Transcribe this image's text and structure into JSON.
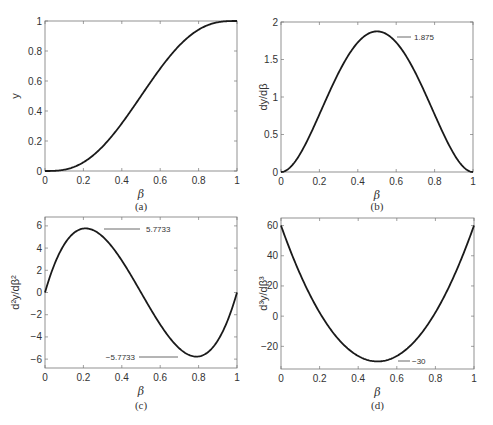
{
  "chart_data": [
    {
      "id": "a",
      "type": "line",
      "caption": "(a)",
      "title": "",
      "xlabel": "β",
      "ylabel": "y",
      "xlim": [
        0,
        1
      ],
      "ylim": [
        0,
        1
      ],
      "xticks": [
        0,
        0.2,
        0.4,
        0.6,
        0.8,
        1
      ],
      "xtick_labels": [
        "0",
        "0.2",
        "0.4",
        "0.6",
        "0.8",
        "1"
      ],
      "yticks": [
        0,
        0.2,
        0.4,
        0.6,
        0.8,
        1
      ],
      "ytick_labels": [
        "0",
        "0.2",
        "0.4",
        "0.6",
        "0.8",
        "1"
      ],
      "grid": false,
      "function": "y = 6β^5 - 15β^4 + 10β^3",
      "x": [
        0,
        0.1,
        0.2,
        0.3,
        0.4,
        0.5,
        0.6,
        0.7,
        0.8,
        0.9,
        1.0
      ],
      "values": [
        0,
        0.0086,
        0.0579,
        0.1631,
        0.3174,
        0.5,
        0.6826,
        0.8369,
        0.9421,
        0.9914,
        1.0
      ],
      "annotations": []
    },
    {
      "id": "b",
      "type": "line",
      "caption": "(b)",
      "title": "",
      "xlabel": "β",
      "ylabel": "dy/dβ",
      "xlim": [
        0,
        1
      ],
      "ylim": [
        0,
        2
      ],
      "xticks": [
        0,
        0.2,
        0.4,
        0.6,
        0.8,
        1
      ],
      "xtick_labels": [
        "0",
        "0.2",
        "0.4",
        "0.6",
        "0.8",
        "1"
      ],
      "yticks": [
        0,
        0.5,
        1,
        1.5,
        2
      ],
      "ytick_labels": [
        "0",
        "0.5",
        "1",
        "1.5",
        "2"
      ],
      "grid": false,
      "function": "dy/dβ = 30β^4 - 60β^3 + 30β^2",
      "x": [
        0,
        0.1,
        0.2,
        0.3,
        0.4,
        0.5,
        0.6,
        0.7,
        0.8,
        0.9,
        1.0
      ],
      "values": [
        0,
        0.243,
        0.768,
        1.323,
        1.728,
        1.875,
        1.728,
        1.323,
        0.768,
        0.243,
        0
      ],
      "annotations": [
        {
          "label": "1.875",
          "x": 0.5,
          "y": 1.875
        }
      ]
    },
    {
      "id": "c",
      "type": "line",
      "caption": "(c)",
      "title": "",
      "xlabel": "β",
      "ylabel": "d²y/dβ²",
      "xlim": [
        0,
        1
      ],
      "ylim": [
        -6.8,
        6.8
      ],
      "xticks": [
        0,
        0.2,
        0.4,
        0.6,
        0.8,
        1
      ],
      "xtick_labels": [
        "0",
        "0.2",
        "0.4",
        "0.6",
        "0.8",
        "1"
      ],
      "yticks": [
        -6,
        -4,
        -2,
        0,
        2,
        4,
        6
      ],
      "ytick_labels": [
        "−6",
        "−4",
        "−2",
        "0",
        "2",
        "4",
        "6"
      ],
      "grid": false,
      "function": "d²y/dβ² = 120β^3 - 180β^2 + 60β",
      "x": [
        0,
        0.1,
        0.2,
        0.2113,
        0.3,
        0.4,
        0.5,
        0.6,
        0.7,
        0.7887,
        0.8,
        0.9,
        1.0
      ],
      "values": [
        0,
        4.32,
        5.76,
        5.7735,
        5.04,
        2.88,
        0,
        -2.88,
        -5.04,
        -5.7735,
        -5.76,
        -4.32,
        0
      ],
      "annotations": [
        {
          "label": "5.7733",
          "x": 0.2113,
          "y": 5.7733
        },
        {
          "label": "−5.7733",
          "x": 0.7887,
          "y": -5.7733
        }
      ]
    },
    {
      "id": "d",
      "type": "line",
      "caption": "(d)",
      "title": "",
      "xlabel": "β",
      "ylabel": "d³y/dβ³",
      "xlim": [
        0,
        1
      ],
      "ylim": [
        -35,
        65
      ],
      "xticks": [
        0,
        0.2,
        0.4,
        0.6,
        0.8,
        1
      ],
      "xtick_labels": [
        "0",
        "0.2",
        "0.4",
        "0.6",
        "0.8",
        "1"
      ],
      "yticks": [
        -20,
        0,
        20,
        40,
        60
      ],
      "ytick_labels": [
        "−20",
        "0",
        "20",
        "40",
        "60"
      ],
      "grid": false,
      "function": "d³y/dβ³ = 360β^2 - 360β + 60",
      "x": [
        0,
        0.1,
        0.2,
        0.3,
        0.4,
        0.5,
        0.6,
        0.7,
        0.8,
        0.9,
        1.0
      ],
      "values": [
        60,
        27.6,
        2.4,
        -15.6,
        -26.4,
        -30,
        -26.4,
        -15.6,
        2.4,
        27.6,
        60
      ],
      "annotations": [
        {
          "label": "−30",
          "x": 0.5,
          "y": -30
        }
      ]
    }
  ],
  "style": {
    "curve_color": "#1a1a1a",
    "axis_color": "#777777",
    "background": "#ffffff"
  }
}
